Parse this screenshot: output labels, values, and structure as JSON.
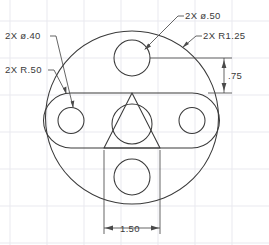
{
  "drawing": {
    "title": "Mechanical Part Orthographic View",
    "background_color": "#ffffff",
    "line_color": "#3a3a3a",
    "grid_color": "#e9e9ef",
    "dimension_color": "#4a4a4a"
  },
  "annotations": {
    "top_hole_callout": "2X  ø.50",
    "outer_radius_callout": "2X  R1.25",
    "slot_hole_callout": "2X  ø.40",
    "slot_radius_callout": "2X  R.50"
  },
  "dimensions": {
    "vertical_075": ".75",
    "horizontal_150": "1.50"
  },
  "geometry": {
    "outer_circle": {
      "cx": 132,
      "cy": 117.5,
      "r": 86.5
    },
    "slot": {
      "left_cap_cx": 71,
      "right_cap_cx": 192,
      "cy": 120.5,
      "cap_r": 27.5,
      "top_y": 93,
      "bottom_y": 148
    },
    "holes": [
      {
        "name": "top-hole",
        "cx": 132,
        "cy": 58,
        "r": 18
      },
      {
        "name": "bottom-hole",
        "cx": 132,
        "cy": 177,
        "r": 18
      },
      {
        "name": "left-slot-hole",
        "cx": 71,
        "cy": 120.5,
        "r": 13
      },
      {
        "name": "right-slot-hole",
        "cx": 192,
        "cy": 120.5,
        "r": 13
      },
      {
        "name": "center-hole",
        "cx": 132,
        "cy": 124,
        "r": 20
      }
    ],
    "triangle": {
      "apex_x": 132,
      "apex_y": 93,
      "left_x": 104,
      "right_x": 160,
      "base_y": 148
    }
  }
}
